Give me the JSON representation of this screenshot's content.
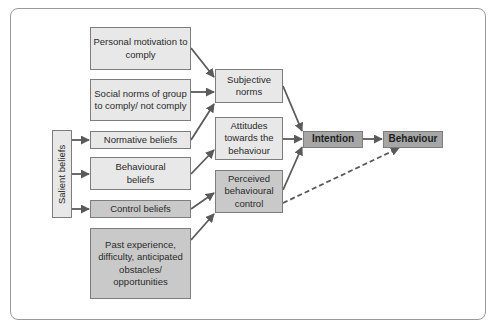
{
  "diagram": {
    "nodes": {
      "personal_motivation": "Personal motivation to comply",
      "social_norms": "Social norms of group to comply/ not comply",
      "normative_beliefs": "Normative beliefs",
      "behavioural_beliefs": "Behavioural beliefs",
      "control_beliefs": "Control beliefs",
      "past_experience": "Past experience, difficulty, anticipated obstacles/ opportunities",
      "salient_beliefs": "Salient beliefs",
      "subjective_norms": "Subjective norms",
      "attitudes": "Attitudes towards the behaviour",
      "perceived_control": "Perceived behavioural control",
      "intention": "Intention",
      "behaviour": "Behaviour"
    },
    "edges": [
      {
        "from": "personal_motivation",
        "to": "subjective_norms",
        "style": "solid"
      },
      {
        "from": "social_norms",
        "to": "subjective_norms",
        "style": "solid"
      },
      {
        "from": "normative_beliefs",
        "to": "subjective_norms",
        "style": "solid"
      },
      {
        "from": "behavioural_beliefs",
        "to": "attitudes",
        "style": "solid"
      },
      {
        "from": "control_beliefs",
        "to": "perceived_control",
        "style": "solid"
      },
      {
        "from": "past_experience",
        "to": "perceived_control",
        "style": "solid"
      },
      {
        "from": "salient_beliefs",
        "to": "normative_beliefs",
        "style": "solid"
      },
      {
        "from": "salient_beliefs",
        "to": "behavioural_beliefs",
        "style": "solid"
      },
      {
        "from": "salient_beliefs",
        "to": "control_beliefs",
        "style": "solid"
      },
      {
        "from": "subjective_norms",
        "to": "intention",
        "style": "solid"
      },
      {
        "from": "attitudes",
        "to": "intention",
        "style": "solid"
      },
      {
        "from": "perceived_control",
        "to": "intention",
        "style": "solid"
      },
      {
        "from": "intention",
        "to": "behaviour",
        "style": "solid"
      },
      {
        "from": "perceived_control",
        "to": "behaviour",
        "style": "dashed"
      }
    ],
    "colors": {
      "light_fill": "#e8e8e8",
      "mid_fill": "#c9c9c9",
      "dark_fill": "#a6a6a6",
      "arrow": "#5a5a5a",
      "border": "#7d7d7d"
    }
  }
}
